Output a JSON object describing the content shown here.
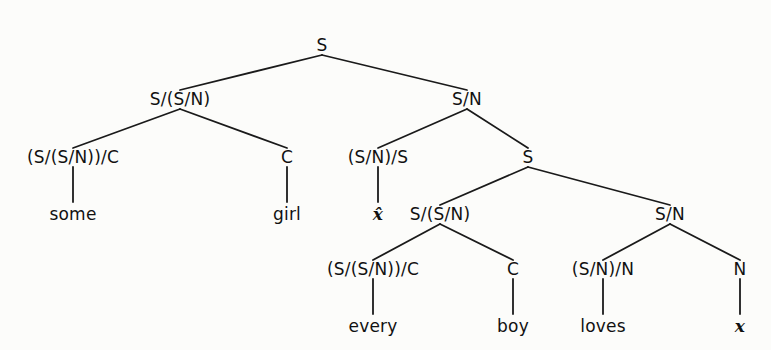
{
  "diagram": {
    "type": "categorial-grammar-derivation-tree",
    "nodes": [
      {
        "id": "n0",
        "label": "S",
        "x": 322,
        "y": 45,
        "parent": null,
        "kind": "category"
      },
      {
        "id": "n1",
        "label": "S/(S/N)",
        "x": 180,
        "y": 99,
        "parent": "n0",
        "kind": "category"
      },
      {
        "id": "n2",
        "label": "S/N",
        "x": 467,
        "y": 99,
        "parent": "n0",
        "kind": "category"
      },
      {
        "id": "n3",
        "label": "(S/(S/N))/C",
        "x": 73,
        "y": 157,
        "parent": "n1",
        "kind": "category"
      },
      {
        "id": "n4",
        "label": "C",
        "x": 287,
        "y": 157,
        "parent": "n1",
        "kind": "category"
      },
      {
        "id": "n5",
        "label": "(S/N)/S",
        "x": 378,
        "y": 157,
        "parent": "n2",
        "kind": "category"
      },
      {
        "id": "n6",
        "label": "S",
        "x": 528,
        "y": 157,
        "parent": "n2",
        "kind": "category"
      },
      {
        "id": "n7",
        "label": "some",
        "x": 73,
        "y": 214,
        "parent": "n3",
        "kind": "word"
      },
      {
        "id": "n8",
        "label": "girl",
        "x": 287,
        "y": 214,
        "parent": "n4",
        "kind": "word"
      },
      {
        "id": "n9",
        "label": "x̂",
        "x": 378,
        "y": 214,
        "parent": "n5",
        "kind": "variable"
      },
      {
        "id": "n10",
        "label": "S/(S/N)",
        "x": 440,
        "y": 214,
        "parent": "n6",
        "kind": "category"
      },
      {
        "id": "n11",
        "label": "S/N",
        "x": 670,
        "y": 214,
        "parent": "n6",
        "kind": "category"
      },
      {
        "id": "n12",
        "label": "(S/(S/N))/C",
        "x": 373,
        "y": 269,
        "parent": "n10",
        "kind": "category"
      },
      {
        "id": "n13",
        "label": "C",
        "x": 513,
        "y": 269,
        "parent": "n10",
        "kind": "category"
      },
      {
        "id": "n14",
        "label": "(S/N)/N",
        "x": 603,
        "y": 269,
        "parent": "n11",
        "kind": "category"
      },
      {
        "id": "n15",
        "label": "N",
        "x": 740,
        "y": 269,
        "parent": "n11",
        "kind": "category"
      },
      {
        "id": "n16",
        "label": "every",
        "x": 373,
        "y": 326,
        "parent": "n12",
        "kind": "word"
      },
      {
        "id": "n17",
        "label": "boy",
        "x": 513,
        "y": 326,
        "parent": "n13",
        "kind": "word"
      },
      {
        "id": "n18",
        "label": "loves",
        "x": 603,
        "y": 326,
        "parent": "n14",
        "kind": "word"
      },
      {
        "id": "n19",
        "label": "x",
        "x": 740,
        "y": 326,
        "parent": "n15",
        "kind": "variable"
      }
    ],
    "colors": {
      "background": "#fcfcfa",
      "ink": "#1a1a1a"
    }
  }
}
